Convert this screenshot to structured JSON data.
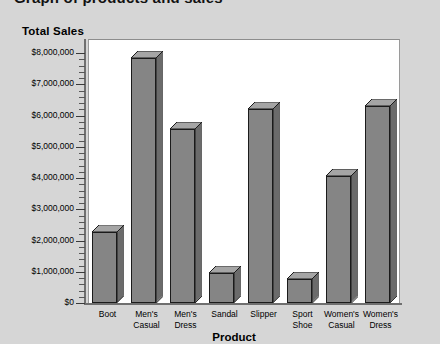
{
  "window": {
    "clipped_top_title": "Graph of products and sales"
  },
  "chart_title": "Total Sales",
  "chart_data": {
    "type": "bar",
    "title": "Total Sales",
    "xlabel": "Product",
    "ylabel": "",
    "categories": [
      "Boot",
      "Men's\nCasual",
      "Men's\nDress",
      "Sandal",
      "Slipper",
      "Sport\nShoe",
      "Women's\nCasual",
      "Women's\nDress"
    ],
    "values": [
      2260000,
      7850000,
      5570000,
      950000,
      6200000,
      780000,
      4080000,
      6300000
    ],
    "ylim": [
      0,
      8000000
    ],
    "ytick_labels": [
      "$8,000,000",
      "$7,000,000",
      "$6,000,000",
      "$5,000,000",
      "$4,000,000",
      "$3,000,000",
      "$2,000,000",
      "$1,000,000",
      "$0"
    ],
    "ytick_values": [
      8000000,
      7000000,
      6000000,
      5000000,
      4000000,
      3000000,
      2000000,
      1000000,
      0
    ],
    "minor_ticks_per_interval": 4,
    "grid": false,
    "legend": false,
    "style": "3d",
    "bar_face_color": "#858585",
    "bar_top_color": "#a5a5a5",
    "bar_side_color": "#6b6b6b",
    "bar_outline_color": "#1b1b1b",
    "plot_background": "#ffffff",
    "page_background": "#d6d6d6"
  }
}
